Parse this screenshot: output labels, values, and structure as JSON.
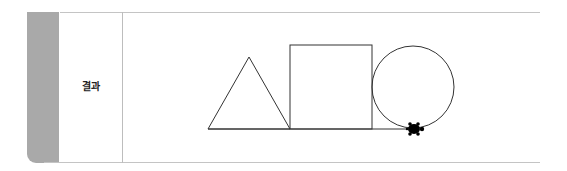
{
  "row": {
    "label": "결과"
  },
  "figure": {
    "shapes": [
      "triangle",
      "square",
      "circle"
    ],
    "stroke_color": "#333333",
    "turtle_color": "#000000"
  },
  "colors": {
    "tab": "#a9a9a9",
    "rule": "#c4c4c4"
  }
}
